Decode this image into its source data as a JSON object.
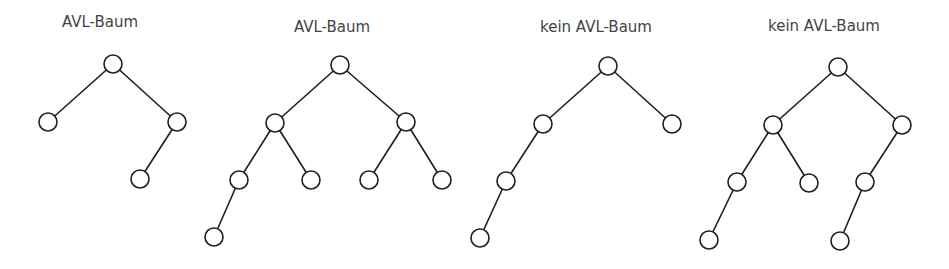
{
  "style": {
    "line_color": "#1e1e1e",
    "node_fill": "#ffffff",
    "label_color": "#444444",
    "node_radius": 9
  },
  "trees": [
    {
      "label": "AVL-Baum",
      "label_pos": [
        100,
        27
      ],
      "nodes": [
        {
          "id": "root",
          "x": 113,
          "y": 64
        },
        {
          "id": "L",
          "x": 48,
          "y": 122
        },
        {
          "id": "R",
          "x": 177,
          "y": 122
        },
        {
          "id": "RL",
          "x": 140,
          "y": 179
        }
      ],
      "edges": [
        [
          "root",
          "L"
        ],
        [
          "root",
          "R"
        ],
        [
          "R",
          "RL"
        ]
      ]
    },
    {
      "label": "AVL-Baum",
      "label_pos": [
        332,
        32
      ],
      "nodes": [
        {
          "id": "root",
          "x": 340,
          "y": 65
        },
        {
          "id": "L",
          "x": 275,
          "y": 123
        },
        {
          "id": "R",
          "x": 406,
          "y": 122
        },
        {
          "id": "LL",
          "x": 239,
          "y": 180
        },
        {
          "id": "LR",
          "x": 311,
          "y": 180
        },
        {
          "id": "RL",
          "x": 369,
          "y": 180
        },
        {
          "id": "RR",
          "x": 442,
          "y": 180
        },
        {
          "id": "LLL",
          "x": 214,
          "y": 237
        }
      ],
      "edges": [
        [
          "root",
          "L"
        ],
        [
          "root",
          "R"
        ],
        [
          "L",
          "LL"
        ],
        [
          "L",
          "LR"
        ],
        [
          "R",
          "RL"
        ],
        [
          "R",
          "RR"
        ],
        [
          "LL",
          "LLL"
        ]
      ]
    },
    {
      "label": "kein AVL-Baum",
      "label_pos": [
        596,
        32
      ],
      "nodes": [
        {
          "id": "root",
          "x": 608,
          "y": 66
        },
        {
          "id": "L",
          "x": 543,
          "y": 124
        },
        {
          "id": "R",
          "x": 672,
          "y": 124
        },
        {
          "id": "LL",
          "x": 506,
          "y": 181
        },
        {
          "id": "LLL",
          "x": 480,
          "y": 238
        }
      ],
      "edges": [
        [
          "root",
          "L"
        ],
        [
          "root",
          "R"
        ],
        [
          "L",
          "LL"
        ],
        [
          "LL",
          "LLL"
        ]
      ]
    },
    {
      "label": "kein AVL-Baum",
      "label_pos": [
        824,
        31
      ],
      "nodes": [
        {
          "id": "root",
          "x": 838,
          "y": 67
        },
        {
          "id": "L",
          "x": 773,
          "y": 125
        },
        {
          "id": "R",
          "x": 902,
          "y": 125
        },
        {
          "id": "LL",
          "x": 737,
          "y": 182
        },
        {
          "id": "LR",
          "x": 809,
          "y": 183
        },
        {
          "id": "RL",
          "x": 865,
          "y": 182
        },
        {
          "id": "LLL",
          "x": 709,
          "y": 240
        },
        {
          "id": "RLL",
          "x": 840,
          "y": 241
        }
      ],
      "edges": [
        [
          "root",
          "L"
        ],
        [
          "root",
          "R"
        ],
        [
          "L",
          "LL"
        ],
        [
          "L",
          "LR"
        ],
        [
          "R",
          "RL"
        ],
        [
          "LL",
          "LLL"
        ],
        [
          "RL",
          "RLL"
        ]
      ]
    }
  ]
}
